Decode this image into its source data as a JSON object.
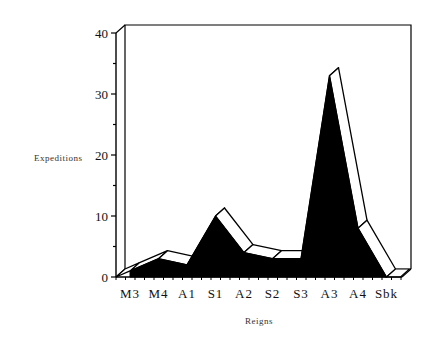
{
  "chart_data": {
    "type": "area",
    "style": "3d-ribbon",
    "title": "",
    "xlabel": "Reigns",
    "ylabel": "Expeditions",
    "categories": [
      "M3",
      "M4",
      "A1",
      "S1",
      "A2",
      "S2",
      "S3",
      "A3",
      "A4",
      "Sbk"
    ],
    "series": [
      {
        "name": "Expeditions",
        "values": [
          1,
          3,
          2,
          10,
          4,
          3,
          3,
          33,
          8,
          0
        ]
      }
    ],
    "ylim": [
      0,
      40
    ],
    "yticks": [
      "0",
      "10",
      "20",
      "30",
      "40"
    ],
    "grid": false,
    "legend": "none",
    "colors": {
      "fill": "#000000",
      "ribbon": "#ffffff",
      "axis": "#000000"
    }
  }
}
